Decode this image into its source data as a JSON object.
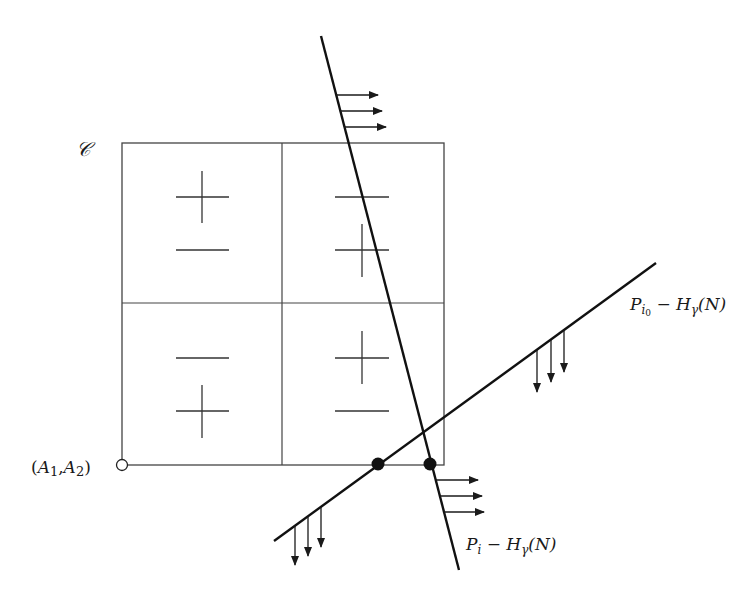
{
  "diagram": {
    "region_label": "𝒞",
    "origin_label": "(A1,A2)",
    "origin_label_parts": {
      "open": "(",
      "a1": "A",
      "sub1": "1",
      "comma": ",",
      "a2": "A",
      "sub2": "2",
      "close": ")"
    },
    "lines": [
      {
        "id": "steep",
        "label": "P_i − H_γ(N)",
        "label_parts": {
          "p": "P",
          "sub": "i",
          "minus": " − ",
          "h": "H",
          "hsub": "γ",
          "arg": "(N)"
        },
        "arrow_direction": "right",
        "arrow_groups": 2
      },
      {
        "id": "shallow",
        "label": "P_i0 − H_γ(N)",
        "label_parts": {
          "p": "P",
          "sub": "i",
          "subsub": "0",
          "minus": " − ",
          "h": "H",
          "hsub": "γ",
          "arg": "(N)"
        },
        "arrow_direction": "down",
        "arrow_groups": 2
      }
    ],
    "cells": [
      {
        "position": "top-left",
        "signs": [
          "+",
          "−"
        ]
      },
      {
        "position": "top-right",
        "signs": [
          "−",
          "+"
        ]
      },
      {
        "position": "bottom-left",
        "signs": [
          "−",
          "+"
        ]
      },
      {
        "position": "bottom-right",
        "signs": [
          "+",
          "−"
        ]
      }
    ],
    "intersection_points": 2,
    "colors": {
      "ink": "#1a1a1a",
      "grid": "#444444",
      "background": "#ffffff"
    }
  }
}
